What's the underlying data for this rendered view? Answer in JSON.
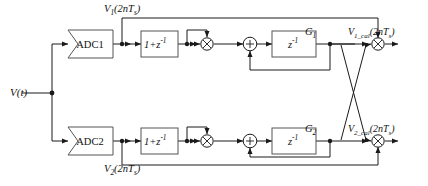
{
  "diagram": {
    "input": {
      "label": "V(t)",
      "name": "input-signal"
    },
    "blocks": {
      "adc1": "ADC1",
      "adc2": "ADC2",
      "fir1": "1+z",
      "fir1_exp": "-1",
      "fir2": "1+z",
      "fir2_exp": "-1",
      "delay1": "z",
      "delay1_exp": "-1",
      "delay2": "z",
      "delay2_exp": "-1"
    },
    "signals": {
      "v1": "V",
      "v1_sub": "1",
      "v1_arg": "(2nT",
      "v1_arg_sub": "s",
      "v1_arg_end": ")",
      "v2": "V",
      "v2_sub": "2",
      "g1": "G",
      "g1_sub": "1",
      "g2": "G",
      "g2_sub": "2",
      "v1cal": "V",
      "v1cal_sub": "1_cal",
      "v2cal": "V",
      "v2cal_sub": "2_cal"
    },
    "operators": {
      "multiply": "⊗",
      "sum": "+"
    },
    "colors": {
      "line": "#1a1a1a",
      "box_stroke": "#555555",
      "box_fill": "#ffffff",
      "background": "#ffffff"
    }
  }
}
